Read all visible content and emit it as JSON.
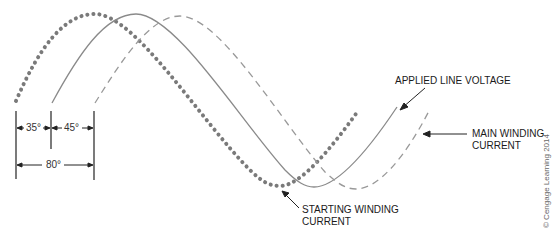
{
  "diagram": {
    "curves": [
      {
        "name": "Starting winding current",
        "style": "dotted",
        "phase_lead_vs_voltage_deg": 35,
        "color": "#777777"
      },
      {
        "name": "Applied line voltage",
        "style": "solid",
        "phase_lead_vs_voltage_deg": 0,
        "color": "#888888"
      },
      {
        "name": "Main winding current",
        "style": "dashed",
        "phase_lag_vs_voltage_deg": 45,
        "color": "#999999"
      }
    ],
    "labels": {
      "applied_line_voltage": "APPLIED LINE VOLTAGE",
      "main_winding_line1": "MAIN WINDING",
      "main_winding_line2": "CURRENT",
      "starting_winding_line1": "STARTING WINDING",
      "starting_winding_line2": "CURRENT"
    },
    "dimensions": {
      "dim1": "35°",
      "dim2": "45°",
      "dim_total": "80°"
    },
    "copyright": "© Cengage Learning 2014"
  }
}
